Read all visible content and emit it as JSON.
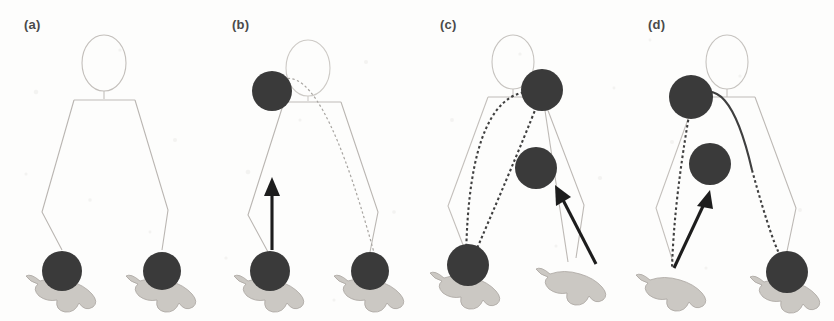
{
  "figure": {
    "panel_count": 4,
    "background_color": "#fdfdfc",
    "ball_color": "#3a3a3a",
    "body_line_color": "#b9b6b2",
    "arrow_color": "#1a1a1a",
    "trajectory_color": "#4a4a4a",
    "hand_color": "#c9c6c1"
  },
  "panels": [
    {
      "id": "a",
      "label": "(a)",
      "description": "Rest pose: both balls held in both hands at bottom",
      "balls": [
        {
          "name": "left-ball",
          "cx": 62,
          "cy": 271,
          "r": 20
        },
        {
          "name": "right-ball",
          "cx": 162,
          "cy": 271,
          "r": 19
        }
      ],
      "arrow": null,
      "trajectory": null
    },
    {
      "id": "b",
      "label": "(b)",
      "description": "Left ball thrown upward to shoulder height; straight vertical arrow",
      "balls": [
        {
          "name": "raised-ball",
          "cx": 64,
          "cy": 91,
          "r": 20
        },
        {
          "name": "left-ball",
          "cx": 62,
          "cy": 271,
          "r": 20
        },
        {
          "name": "right-ball",
          "cx": 162,
          "cy": 271,
          "r": 19
        }
      ],
      "arrow": {
        "name": "up-arrow",
        "x1": 64,
        "y1": 250,
        "x2": 64,
        "y2": 183,
        "angle_deg": 90
      },
      "trajectory": "arc-over-head"
    },
    {
      "id": "c",
      "label": "(c)",
      "description": "Right ball lifted to shoulder; second ball mid-flight descending along dotted arc; tilted arrow up-left",
      "balls": [
        {
          "name": "raised-ball",
          "cx": 126,
          "cy": 90,
          "r": 21
        },
        {
          "name": "midair-ball",
          "cx": 120,
          "cy": 168,
          "r": 21
        },
        {
          "name": "left-ball",
          "cx": 52,
          "cy": 265,
          "r": 21
        }
      ],
      "arrow": {
        "name": "up-left-arrow",
        "x1": 178,
        "y1": 262,
        "x2": 142,
        "y2": 192,
        "angle_deg": 117
      },
      "trajectory": "dotted-arc-left"
    },
    {
      "id": "d",
      "label": "(d)",
      "description": "Left ball raised at shoulder; second ball mid-flight; right ball in right hand; tilted arrow up-right",
      "balls": [
        {
          "name": "raised-ball",
          "cx": 67,
          "cy": 97,
          "r": 22
        },
        {
          "name": "midair-ball",
          "cx": 86,
          "cy": 164,
          "r": 21
        },
        {
          "name": "right-ball",
          "cx": 163,
          "cy": 272,
          "r": 21
        }
      ],
      "arrow": {
        "name": "up-right-arrow",
        "x1": 51,
        "y1": 266,
        "x2": 80,
        "y2": 198,
        "angle_deg": 67
      },
      "trajectory": "dotted-arc-right"
    }
  ]
}
